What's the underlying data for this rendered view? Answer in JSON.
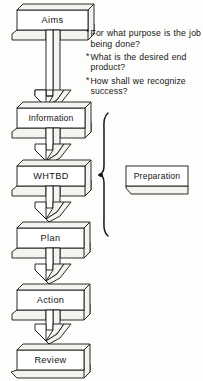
{
  "diagram": {
    "ink_color": "#141414",
    "paper_color": "#fdfdfb",
    "shade_color": "#f2f2ee",
    "flow_boxes": [
      {
        "id": "aims",
        "label": "Aims"
      },
      {
        "id": "information",
        "label": "Information"
      },
      {
        "id": "whtbd",
        "label": "WHTBD"
      },
      {
        "id": "plan",
        "label": "Plan"
      },
      {
        "id": "action",
        "label": "Action"
      },
      {
        "id": "review",
        "label": "Review"
      }
    ],
    "side_box": {
      "id": "preparation",
      "label": "Preparation"
    },
    "bullets": [
      {
        "mark": "*",
        "text": "For what purpose is the job being done?"
      },
      {
        "mark": "*",
        "text": "What is the desired end product?"
      },
      {
        "mark": "*",
        "text": "How shall we recognize success?"
      }
    ],
    "brace": {
      "name": "grouping-brace",
      "spans_from": "Information",
      "spans_to": "Plan"
    },
    "arrows": [
      {
        "from": "aims",
        "to": "information",
        "style": "long-block-arrow"
      },
      {
        "from": "information",
        "to": "whtbd",
        "style": "short-block-arrow"
      },
      {
        "from": "whtbd",
        "to": "plan",
        "style": "short-block-arrow"
      },
      {
        "from": "plan",
        "to": "action",
        "style": "short-block-arrow"
      },
      {
        "from": "action",
        "to": "review",
        "style": "short-block-arrow"
      }
    ]
  }
}
